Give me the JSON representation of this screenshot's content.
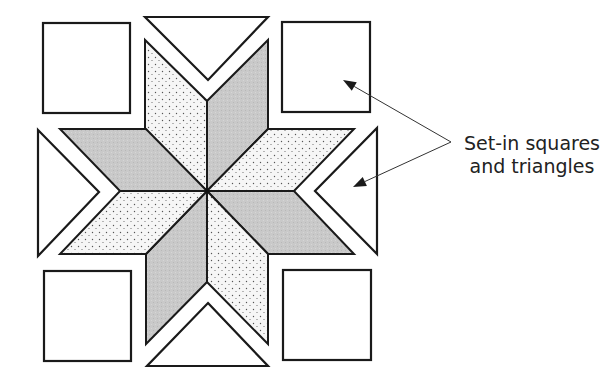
{
  "diagram": {
    "annotation": {
      "line1": "Set-in squares",
      "line2": "and triangles"
    },
    "colors": {
      "outline": "#1a1a1a",
      "gray_fill": "#c8c8c8",
      "dotted_fill_bg": "#f4f4f4",
      "dot": "#555555",
      "background": "#ffffff"
    },
    "center": [
      207,
      191
    ],
    "corner_squares": [
      {
        "id": "top-left",
        "x": 43,
        "y": 23,
        "w": 87,
        "h": 90
      },
      {
        "id": "top-right",
        "x": 282,
        "y": 22,
        "w": 88,
        "h": 90
      },
      {
        "id": "bottom-left",
        "x": 44,
        "y": 271,
        "w": 87,
        "h": 90
      },
      {
        "id": "bottom-right",
        "x": 283,
        "y": 270,
        "w": 88,
        "h": 90
      }
    ],
    "side_triangles": [
      {
        "id": "top",
        "points": "145,17 268,17 208,80"
      },
      {
        "id": "right",
        "points": "377,128 377,254 315,191"
      },
      {
        "id": "bottom",
        "points": "208,303 268,366 147,366"
      },
      {
        "id": "left",
        "points": "38,130 99,192 38,256"
      }
    ],
    "star_diamonds": [
      {
        "id": "up-left",
        "fill": "dotted",
        "points": "207,191 145,129 145,40 207,101"
      },
      {
        "id": "up-right",
        "fill": "gray",
        "points": "207,191 207,101 268,40 268,129"
      },
      {
        "id": "right-up",
        "fill": "dotted",
        "points": "207,191 268,129 354,129 294,191"
      },
      {
        "id": "right-down",
        "fill": "gray",
        "points": "207,191 294,191 354,254 268,254"
      },
      {
        "id": "down-right",
        "fill": "dotted",
        "points": "207,191 268,254 268,344 207,282"
      },
      {
        "id": "down-left",
        "fill": "gray",
        "points": "207,191 207,282 146,344 146,254"
      },
      {
        "id": "left-down",
        "fill": "dotted",
        "points": "207,191 146,254 60,254 120,191"
      },
      {
        "id": "left-up",
        "fill": "gray",
        "points": "207,191 120,191 60,129 146,129"
      }
    ],
    "arrows": [
      {
        "id": "to-square",
        "from": [
          451,
          142
        ],
        "to": [
          343,
          80
        ]
      },
      {
        "id": "to-triangle",
        "from": [
          451,
          142
        ],
        "to": [
          353,
          187
        ]
      }
    ]
  }
}
